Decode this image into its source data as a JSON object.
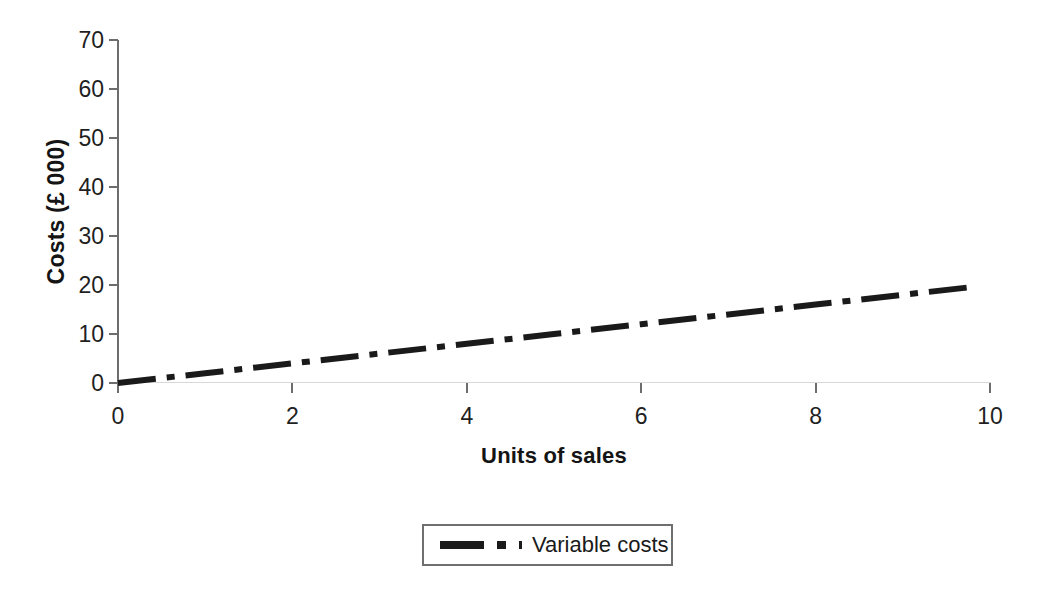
{
  "chart_data": {
    "type": "line",
    "title": "",
    "xlabel": "Units of sales",
    "ylabel": "Costs (£ 000)",
    "xlim": [
      0,
      10
    ],
    "ylim": [
      0,
      70
    ],
    "xticks": [
      "0",
      "2",
      "4",
      "6",
      "8",
      "10"
    ],
    "xtick_values": [
      0,
      2,
      4,
      6,
      8,
      10
    ],
    "yticks": [
      "0",
      "10",
      "20",
      "30",
      "40",
      "50",
      "60",
      "70"
    ],
    "ytick_values": [
      0,
      10,
      20,
      30,
      40,
      50,
      60,
      70
    ],
    "grid": false,
    "legend_position": "below-center",
    "series": [
      {
        "name": "Variable costs",
        "color": "#1a1a1a",
        "linestyle": "dashdot",
        "linewidth": 6,
        "x": [
          0,
          1,
          2,
          3,
          4,
          5,
          6,
          7,
          8,
          9,
          9.8
        ],
        "values": [
          0,
          2,
          4,
          6,
          8,
          10,
          12,
          14,
          16,
          18,
          19.6
        ]
      }
    ]
  },
  "legend": {
    "entries": [
      {
        "label": "Variable costs"
      }
    ]
  },
  "axes": {
    "y_title": "Costs (£ 000)",
    "x_title": "Units of sales"
  }
}
